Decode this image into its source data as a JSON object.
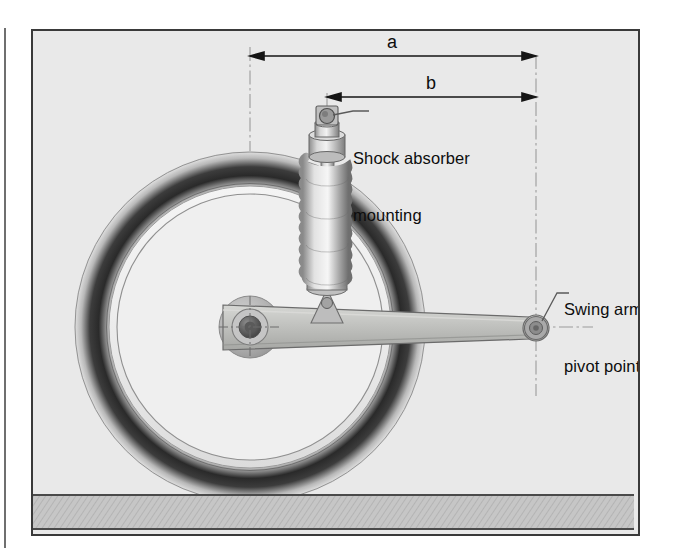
{
  "figure": {
    "kind": "technical-illustration",
    "background_color": "#e9e9e9",
    "frame_border_color": "#3a3a3a",
    "page_rule_color": "#6f6f6f"
  },
  "dimensions": [
    {
      "id": "a",
      "label": "a",
      "x_start": 248,
      "x_end": 534,
      "y": 53,
      "label_x": 388,
      "label_y": 28,
      "from": "wheel axle centreline",
      "to": "swing arm pivot centreline"
    },
    {
      "id": "b",
      "label": "b",
      "x_start": 325,
      "x_end": 534,
      "y": 94,
      "label_x": 425,
      "label_y": 70,
      "from": "shock absorber mounting centreline",
      "to": "swing arm pivot centreline"
    }
  ],
  "callouts": [
    {
      "id": "shock-absorber-mounting",
      "line1": "Shock absorber",
      "line2": "mounting",
      "text_x": 352,
      "text_y": 117,
      "leader_from_x": 333,
      "leader_from_y": 134,
      "leader_to_x": 350,
      "leader_to_y": 127,
      "clipped": false
    },
    {
      "id": "swing-arm-pivot-point",
      "line1": "Swing arm",
      "line2": "pivot point",
      "text_x": 563,
      "text_y": 268,
      "leader_from_x": 540,
      "leader_from_y": 320,
      "leader_to_x": 560,
      "leader_to_y": 288,
      "clipped": true,
      "clipped_note": "text runs under the right frame border and is cut off"
    }
  ],
  "components": {
    "wheel": {
      "name": "rear wheel",
      "centre_x": 248,
      "centre_y": 325,
      "tire_outer_radius": 175,
      "tire_inner_radius": 143,
      "rim_radius": 136,
      "tire_color_dark": "#303030",
      "tire_color_light": "#d8d8d8",
      "rim_face_color": "#efefef",
      "rim_edge_color": "#808080"
    },
    "hub": {
      "name": "wheel hub and axle",
      "centre_x": 248,
      "centre_y": 325,
      "boss_radius": 30,
      "ring_radius": 17,
      "axle_radius": 8,
      "boss_color": "#b9b9b9",
      "axle_color": "#5d5d5d"
    },
    "swing_arm": {
      "name": "swing arm",
      "axle_end_x": 222,
      "axle_end_y": 325,
      "pivot_end_x": 534,
      "pivot_end_y": 327,
      "height_at_axle": 46,
      "height_at_pivot": 24,
      "face_color": "#c2c3c0",
      "edge_color": "#6b6b6b"
    },
    "pivot": {
      "name": "swing arm pivot point",
      "centre_x": 534,
      "centre_y": 327,
      "outer_radius": 12,
      "inner_radius": 6,
      "color": "#9b9b9b"
    },
    "shock_absorber": {
      "name": "shock absorber / monoshock",
      "top_eye_x": 325,
      "top_eye_y": 133,
      "bottom_mount_x": 325,
      "bottom_mount_y": 297,
      "body_color": "#b4b4b4",
      "spring_color": "#c9c9c9",
      "spring_coils": 11,
      "spring_top_y": 170,
      "spring_bottom_y": 285
    },
    "ground": {
      "name": "ground / road surface band",
      "top_y": 495,
      "bottom_y": 530,
      "fill_color": "#c4c4c4",
      "line_color": "#4a4a4a",
      "hatched": true
    },
    "centrelines": {
      "name": "dash-dot construction centrelines",
      "color": "#9a9a9a",
      "vertical_lines_x": [
        248,
        325,
        534
      ],
      "horizontal_line_y": 325
    }
  }
}
